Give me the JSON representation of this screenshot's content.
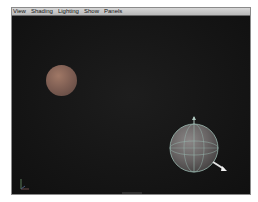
{
  "menubar": {
    "items": [
      {
        "label": "View"
      },
      {
        "label": "Shading"
      },
      {
        "label": "Lighting"
      },
      {
        "label": "Show"
      },
      {
        "label": "Panels"
      }
    ]
  },
  "viewport": {
    "background": "#141414",
    "objects": [
      {
        "name": "small-sphere",
        "color": "#8a6556",
        "selected": false
      },
      {
        "name": "large-sphere",
        "color": "#6e6a6a",
        "wireframe_color": "#9ab9b0",
        "selected": true,
        "manipulator": "rotate/move"
      }
    ],
    "axis_indicator": [
      "x",
      "y",
      "z"
    ]
  }
}
